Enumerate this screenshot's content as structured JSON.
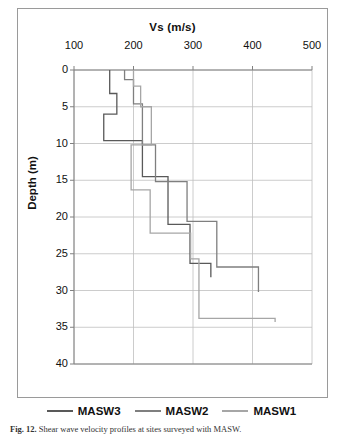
{
  "caption": {
    "label": "Fig. 12.",
    "text": " Shear wave velocity profiles at sites surveyed with MASW."
  },
  "legend": {
    "items": [
      {
        "label": "MASW3",
        "color": "#595959"
      },
      {
        "label": "MASW2",
        "color": "#7f7f7f"
      },
      {
        "label": "MASW1",
        "color": "#a6a6a6"
      }
    ]
  },
  "chart_data": {
    "type": "line",
    "title": "Vs (m/s)",
    "xlabel": "Vs (m/s)",
    "ylabel": "Depth (m)",
    "xlim": [
      100,
      500
    ],
    "ylim": [
      0,
      40
    ],
    "y_inverted": true,
    "xticks": [
      100,
      200,
      300,
      400,
      500
    ],
    "yticks": [
      0,
      5,
      10,
      15,
      20,
      25,
      30,
      35,
      40
    ],
    "grid": true,
    "legend_position": "bottom",
    "series": [
      {
        "name": "MASW3",
        "color": "#595959",
        "step": true,
        "points": [
          {
            "vs": 160,
            "depth": 0
          },
          {
            "vs": 160,
            "depth": 3.2
          },
          {
            "vs": 172,
            "depth": 3.2
          },
          {
            "vs": 172,
            "depth": 6.0
          },
          {
            "vs": 150,
            "depth": 6.0
          },
          {
            "vs": 150,
            "depth": 9.6
          },
          {
            "vs": 215,
            "depth": 9.6
          },
          {
            "vs": 215,
            "depth": 14.5
          },
          {
            "vs": 258,
            "depth": 14.5
          },
          {
            "vs": 258,
            "depth": 21.0
          },
          {
            "vs": 295,
            "depth": 21.0
          },
          {
            "vs": 295,
            "depth": 26.3
          },
          {
            "vs": 330,
            "depth": 26.3
          },
          {
            "vs": 330,
            "depth": 28.2
          }
        ]
      },
      {
        "name": "MASW2",
        "color": "#7f7f7f",
        "step": true,
        "points": [
          {
            "vs": 185,
            "depth": 0
          },
          {
            "vs": 185,
            "depth": 1.3
          },
          {
            "vs": 200,
            "depth": 1.3
          },
          {
            "vs": 200,
            "depth": 4.6
          },
          {
            "vs": 215,
            "depth": 4.6
          },
          {
            "vs": 215,
            "depth": 10.2
          },
          {
            "vs": 237,
            "depth": 10.2
          },
          {
            "vs": 237,
            "depth": 15.2
          },
          {
            "vs": 290,
            "depth": 15.2
          },
          {
            "vs": 290,
            "depth": 20.6
          },
          {
            "vs": 340,
            "depth": 20.6
          },
          {
            "vs": 340,
            "depth": 26.8
          },
          {
            "vs": 410,
            "depth": 26.8
          },
          {
            "vs": 410,
            "depth": 30.2
          }
        ]
      },
      {
        "name": "MASW1",
        "color": "#a6a6a6",
        "step": true,
        "points": [
          {
            "vs": 200,
            "depth": 0
          },
          {
            "vs": 200,
            "depth": 2.2
          },
          {
            "vs": 212,
            "depth": 2.2
          },
          {
            "vs": 212,
            "depth": 5.0
          },
          {
            "vs": 230,
            "depth": 5.0
          },
          {
            "vs": 230,
            "depth": 10.2
          },
          {
            "vs": 196,
            "depth": 10.2
          },
          {
            "vs": 196,
            "depth": 16.3
          },
          {
            "vs": 228,
            "depth": 16.3
          },
          {
            "vs": 228,
            "depth": 22.2
          },
          {
            "vs": 296,
            "depth": 22.2
          },
          {
            "vs": 296,
            "depth": 25.7
          },
          {
            "vs": 310,
            "depth": 25.7
          },
          {
            "vs": 310,
            "depth": 33.8
          },
          {
            "vs": 438,
            "depth": 33.8
          },
          {
            "vs": 438,
            "depth": 34.3
          }
        ]
      }
    ]
  }
}
